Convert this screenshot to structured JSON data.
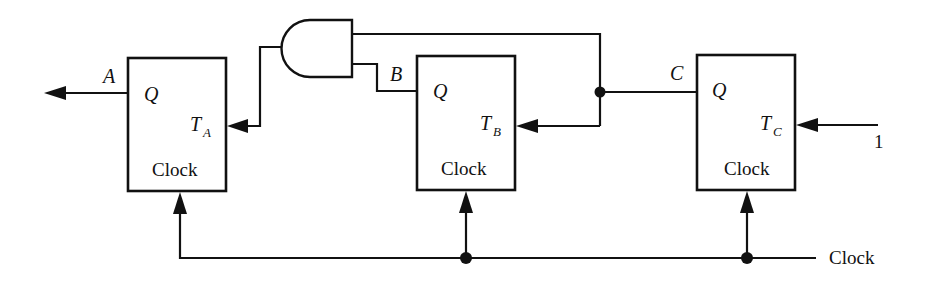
{
  "diagram": {
    "type": "sequential-circuit",
    "colors": {
      "ink": "#111111",
      "background": "#ffffff"
    },
    "flip_flops": [
      {
        "id": "A",
        "output_label": "Q",
        "input_label": "T",
        "input_subscript": "A",
        "clock_label": "Clock",
        "output_signal": "A"
      },
      {
        "id": "B",
        "output_label": "Q",
        "input_label": "T",
        "input_subscript": "B",
        "clock_label": "Clock",
        "output_signal": "B"
      },
      {
        "id": "C",
        "output_label": "Q",
        "input_label": "T",
        "input_subscript": "C",
        "clock_label": "Clock",
        "output_signal": "C"
      }
    ],
    "gate": {
      "type": "AND",
      "inputs": [
        "B",
        "C"
      ],
      "output": "T_A"
    },
    "signals": {
      "constant_input": "1",
      "clock_input": "Clock"
    },
    "connections": [
      {
        "from": "C",
        "to": "T_B"
      },
      {
        "from": "C",
        "to": "AND.in1"
      },
      {
        "from": "B",
        "to": "AND.in2"
      },
      {
        "from": "AND.out",
        "to": "T_A"
      },
      {
        "from": "1",
        "to": "T_C"
      },
      {
        "from": "Clock",
        "to": [
          "FF_A.clock",
          "FF_B.clock",
          "FF_C.clock"
        ]
      },
      {
        "from": "A",
        "to": "output"
      }
    ]
  }
}
